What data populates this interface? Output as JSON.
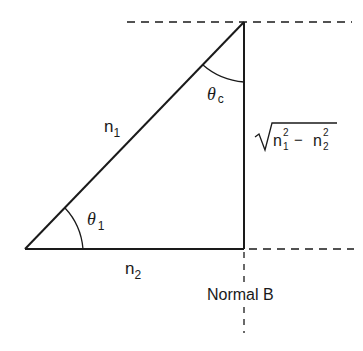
{
  "diagram": {
    "colors": {
      "stroke": "#1a1a1a",
      "background": "#ffffff"
    },
    "vertices": {
      "left": [
        25,
        249
      ],
      "right_angle": [
        244,
        249
      ],
      "apex": [
        244,
        22
      ]
    },
    "edges": {
      "hypotenuse": {
        "label_base": "n",
        "label_sub": "1"
      },
      "base": {
        "label_base": "n",
        "label_sub": "2"
      },
      "vertical": {
        "label_radicand_a_base": "n",
        "label_radicand_a_sup": "2",
        "label_radicand_a_sub": "1",
        "label_minus": "−",
        "label_radicand_b_base": "n",
        "label_radicand_b_sup": "2",
        "label_radicand_b_sub": "2"
      }
    },
    "angles": {
      "theta_1": {
        "symbol": "θ",
        "sub": "1"
      },
      "theta_c": {
        "symbol": "θ",
        "sub": "c"
      }
    },
    "reference_lines": {
      "top_dashed": "horizontal dashed line through apex",
      "bottom_dashed": "horizontal dashed line extending right from right-angle corner",
      "normal": "vertical dashed line below right-angle corner"
    },
    "normal_label": "Normal B"
  }
}
